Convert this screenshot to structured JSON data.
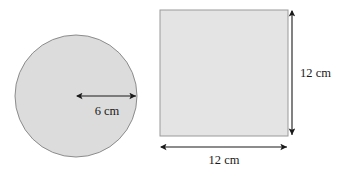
{
  "figure": {
    "background_color": "#ffffff",
    "shapes": [
      {
        "id": "circle",
        "kind": "circle",
        "fill_color": "#dcdcdc",
        "stroke_color": "#8c8c8c",
        "center_x": 76,
        "center_y": 96,
        "radius_px": 61,
        "dimension": {
          "name": "radius",
          "label": "6 cm",
          "value": 6,
          "unit": "cm",
          "arrow_style": "double-headed"
        }
      },
      {
        "id": "square",
        "kind": "square",
        "fill_color": "#e4e4e4",
        "stroke_color": "#9a9a9a",
        "left": 160,
        "top": 10,
        "width_px": 128,
        "height_px": 126,
        "dimensions": [
          {
            "name": "height",
            "label": "12 cm",
            "value": 12,
            "unit": "cm",
            "orientation": "vertical",
            "arrow_style": "double-headed"
          },
          {
            "name": "width",
            "label": "12 cm",
            "value": 12,
            "unit": "cm",
            "orientation": "horizontal",
            "arrow_style": "double-headed"
          }
        ]
      }
    ],
    "labels": {
      "circle_radius": "6 cm",
      "square_height": "12 cm",
      "square_width": "12 cm"
    }
  }
}
